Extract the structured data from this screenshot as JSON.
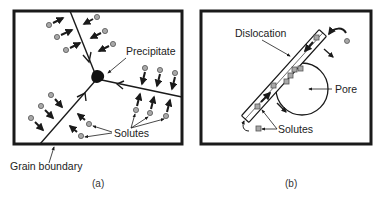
{
  "figure": {
    "panel_a": {
      "caption": "(a)",
      "labels": {
        "precipitate": "Precipitate",
        "solutes": "Solutes",
        "grain_boundary": "Grain boundary"
      }
    },
    "panel_b": {
      "caption": "(b)",
      "labels": {
        "dislocation": "Dislocation",
        "pore": "Pore",
        "solutes": "Solutes"
      }
    }
  },
  "colors": {
    "line": "#1a1a1a",
    "solute_fill": "#a8a8a8",
    "solute_stroke": "#555555",
    "precipitate": "#111111"
  }
}
